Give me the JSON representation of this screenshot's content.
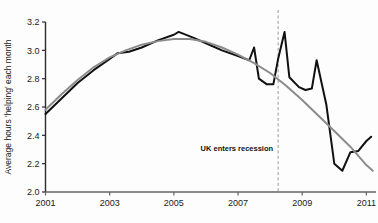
{
  "chart_data": {
    "type": "line",
    "title": "",
    "xlabel": "",
    "ylabel": "Average hours 'helping' each month",
    "xlim": [
      2001,
      2011.3
    ],
    "ylim": [
      2.0,
      3.2
    ],
    "grid": false,
    "legend": "none",
    "x_ticks": [
      "2001",
      "2003",
      "2005",
      "2007",
      "2009",
      "2011"
    ],
    "x_tick_values": [
      2001,
      2003,
      2005,
      2007,
      2009,
      2011
    ],
    "y_ticks": [
      "2.0",
      "2.2",
      "2.4",
      "2.6",
      "2.8",
      "3.0",
      "3.2"
    ],
    "y_tick_values": [
      2.0,
      2.2,
      2.4,
      2.6,
      2.8,
      3.0,
      3.2
    ],
    "annotations": [
      {
        "label": "UK enters recession",
        "x": 2008.25,
        "type": "vertical-dashed-line",
        "color": "#9a9a9a"
      }
    ],
    "series": [
      {
        "name": "Observed average hours helping",
        "color": "#111111",
        "width": 2.0,
        "x": [
          2001.0,
          2001.5,
          2002.0,
          2002.5,
          2003.0,
          2003.25,
          2003.6,
          2004.0,
          2004.5,
          2005.0,
          2005.15,
          2005.6,
          2006.0,
          2006.5,
          2007.0,
          2007.35,
          2007.5,
          2007.65,
          2007.9,
          2008.1,
          2008.25,
          2008.45,
          2008.6,
          2008.9,
          2009.1,
          2009.3,
          2009.45,
          2009.75,
          2010.0,
          2010.25,
          2010.5,
          2010.75,
          2011.0,
          2011.15
        ],
        "y": [
          2.55,
          2.66,
          2.77,
          2.86,
          2.94,
          2.98,
          2.99,
          3.02,
          3.07,
          3.11,
          3.13,
          3.09,
          3.05,
          3.0,
          2.96,
          2.93,
          3.02,
          2.8,
          2.76,
          2.76,
          2.94,
          3.13,
          2.81,
          2.74,
          2.72,
          2.73,
          2.93,
          2.62,
          2.2,
          2.15,
          2.28,
          2.29,
          2.36,
          2.39
        ]
      },
      {
        "name": "Smoothed trend",
        "color": "#8c8c8c",
        "width": 2.0,
        "x": [
          2001.0,
          2001.5,
          2002.0,
          2002.5,
          2003.0,
          2003.5,
          2004.0,
          2004.5,
          2005.0,
          2005.5,
          2006.0,
          2006.5,
          2007.0,
          2007.5,
          2008.0,
          2008.5,
          2009.0,
          2009.5,
          2010.0,
          2010.5,
          2011.0,
          2011.2
        ],
        "y": [
          2.58,
          2.69,
          2.79,
          2.88,
          2.95,
          3.0,
          3.04,
          3.065,
          3.08,
          3.08,
          3.06,
          3.02,
          2.97,
          2.91,
          2.84,
          2.75,
          2.65,
          2.54,
          2.43,
          2.32,
          2.19,
          2.15
        ]
      }
    ]
  },
  "axes": {
    "y_axis_label": "Average hours 'helping' each month"
  }
}
